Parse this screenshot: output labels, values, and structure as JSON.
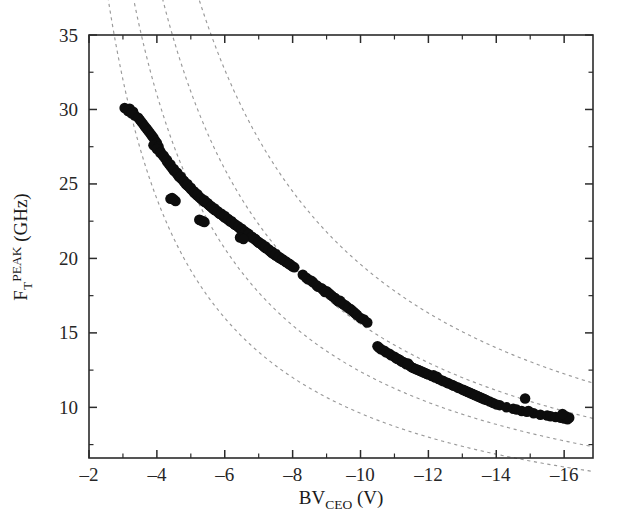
{
  "figure": {
    "background_color": "#ffffff",
    "frame_color": "#2b2b2b",
    "marker_color": "#0d0d0d",
    "guide_color": "#9a9a9a"
  },
  "axes": {
    "x": {
      "title_main": "BV",
      "title_sub": "CEO",
      "title_unit": " (V)",
      "full_label": "BV_CEO (V)",
      "min": -2,
      "max": -16.85,
      "major_ticks": [
        -2,
        -4,
        -6,
        -8,
        -10,
        -12,
        -14,
        -16
      ],
      "major_tick_labels": [
        "–2",
        "–4",
        "–6",
        "–8",
        "–10",
        "–12",
        "–14",
        "–16"
      ],
      "minor_ticks": [
        -3,
        -5,
        -7,
        -9,
        -11,
        -13,
        -15
      ]
    },
    "y": {
      "title_main": "F",
      "title_sub": "T",
      "title_sup": "PEAK",
      "title_unit": " (GHz)",
      "full_label": "F_T^PEAK (GHz)",
      "min": 6.6,
      "max": 35,
      "major_ticks": [
        10,
        15,
        20,
        25,
        30,
        35
      ],
      "major_tick_labels": [
        "10",
        "15",
        "20",
        "25",
        "30",
        "35"
      ],
      "minor_ticks": [
        7.5,
        12.5,
        17.5,
        22.5,
        27.5,
        32.5
      ]
    }
  },
  "chart_data": {
    "type": "scatter",
    "title": "",
    "xlabel": "BV_CEO (V)",
    "ylabel": "F_T^PEAK (GHz)",
    "xlim": [
      -2,
      -16.85
    ],
    "ylim": [
      6.6,
      35
    ],
    "grid": false,
    "legend": "none",
    "series": [
      {
        "name": "measured devices",
        "marker": "filled-circle",
        "color": "#0d0d0d",
        "marker_size_px": 10.5,
        "x": [
          -3.05,
          -3.2,
          -3.15,
          -3.3,
          -3.35,
          -3.25,
          -3.5,
          -3.45,
          -3.6,
          -3.55,
          -3.7,
          -3.65,
          -3.8,
          -3.75,
          -3.9,
          -3.85,
          -3.95,
          -4.0,
          -3.9,
          -4.05,
          -4.1,
          -4.0,
          -4.15,
          -4.2,
          -4.1,
          -4.25,
          -4.3,
          -4.2,
          -4.35,
          -4.4,
          -4.3,
          -4.45,
          -4.5,
          -4.4,
          -4.55,
          -4.6,
          -4.5,
          -4.65,
          -4.7,
          -4.6,
          -4.75,
          -4.8,
          -4.7,
          -4.85,
          -4.9,
          -4.8,
          -4.95,
          -5.0,
          -4.9,
          -5.05,
          -5.1,
          -5.0,
          -5.15,
          -5.2,
          -5.1,
          -5.25,
          -5.3,
          -5.2,
          -5.35,
          -5.4,
          -5.3,
          -5.45,
          -5.5,
          -5.4,
          -5.55,
          -5.6,
          -5.5,
          -5.65,
          -5.7,
          -5.6,
          -5.75,
          -5.8,
          -5.7,
          -5.85,
          -5.9,
          -5.8,
          -5.95,
          -6.0,
          -5.9,
          -6.05,
          -6.1,
          -6.0,
          -6.15,
          -6.2,
          -6.1,
          -6.25,
          -6.3,
          -6.2,
          -6.35,
          -6.4,
          -6.3,
          -6.45,
          -6.5,
          -6.4,
          -6.55,
          -6.6,
          -6.5,
          -6.65,
          -6.7,
          -6.6,
          -6.75,
          -6.8,
          -6.7,
          -6.85,
          -6.9,
          -6.8,
          -6.95,
          -7.0,
          -6.9,
          -7.05,
          -7.1,
          -7.0,
          -7.15,
          -7.2,
          -7.1,
          -7.25,
          -7.3,
          -7.2,
          -7.35,
          -7.4,
          -7.3,
          -7.45,
          -7.5,
          -7.4,
          -7.55,
          -7.6,
          -7.5,
          -7.65,
          -7.7,
          -7.6,
          -7.75,
          -7.8,
          -7.7,
          -7.85,
          -7.9,
          -7.8,
          -7.95,
          -8.0,
          -7.9,
          -8.05,
          -4.4,
          -4.55,
          -4.5,
          -4.45,
          -5.25,
          -5.35,
          -5.3,
          -5.4,
          -6.45,
          -6.55,
          -8.3,
          -8.45,
          -8.4,
          -8.6,
          -8.55,
          -8.7,
          -8.75,
          -8.9,
          -8.85,
          -9.0,
          -9.05,
          -9.2,
          -9.15,
          -9.3,
          -9.35,
          -9.5,
          -9.45,
          -9.6,
          -9.55,
          -9.7,
          -9.25,
          -9.4,
          -9.1,
          -8.95,
          -9.65,
          -9.75,
          -9.8,
          -9.85,
          -9.9,
          -10.0,
          -10.5,
          -10.6,
          -10.55,
          -10.7,
          -10.75,
          -10.9,
          -10.85,
          -11.0,
          -11.05,
          -11.2,
          -11.15,
          -11.3,
          -11.35,
          -11.5,
          -11.45,
          -11.6,
          -11.55,
          -11.7,
          -11.75,
          -11.9,
          -11.1,
          -11.25,
          -11.4,
          -11.65,
          -11.8,
          -11.85,
          -11.95,
          -12.0,
          -12.1,
          -12.2,
          -12.3,
          -12.45,
          -12.4,
          -12.6,
          -12.55,
          -12.7,
          -12.75,
          -12.9,
          -12.85,
          -13.0,
          -13.05,
          -13.2,
          -13.15,
          -13.3,
          -13.35,
          -13.5,
          -13.45,
          -13.6,
          -13.1,
          -13.25,
          -13.4,
          -13.55,
          -13.65,
          -13.7,
          -13.8,
          -13.9,
          -14.0,
          -14.1,
          -14.3,
          -14.5,
          -14.6,
          -14.75,
          -14.9,
          -15.1,
          -15.3,
          -15.5,
          -15.6,
          -15.75,
          -15.9,
          -16.0,
          -16.1,
          -16.15,
          -16.05,
          -15.95,
          -14.85,
          -14.95,
          -12.15,
          -12.25,
          -10.1,
          -10.2
        ],
        "y": [
          30.1,
          30.05,
          29.9,
          29.85,
          29.6,
          29.75,
          29.3,
          29.45,
          29.0,
          29.15,
          28.7,
          28.85,
          28.4,
          28.55,
          28.1,
          28.25,
          27.9,
          27.75,
          27.6,
          27.5,
          27.2,
          27.35,
          27.0,
          26.85,
          27.1,
          26.7,
          26.5,
          26.9,
          26.35,
          26.2,
          26.6,
          26.05,
          25.9,
          26.3,
          25.8,
          25.65,
          26.0,
          25.5,
          25.4,
          25.75,
          25.3,
          25.15,
          25.5,
          25.0,
          24.9,
          25.2,
          24.8,
          24.65,
          25.0,
          24.55,
          24.4,
          24.75,
          24.3,
          24.2,
          24.5,
          24.1,
          24.0,
          24.3,
          23.9,
          23.8,
          24.05,
          23.75,
          23.65,
          23.9,
          23.55,
          23.45,
          23.7,
          23.35,
          23.25,
          23.5,
          23.2,
          23.1,
          23.35,
          23.0,
          22.95,
          23.15,
          22.85,
          22.75,
          23.0,
          22.7,
          22.6,
          22.85,
          22.5,
          22.45,
          22.65,
          22.35,
          22.25,
          22.5,
          22.2,
          22.1,
          22.3,
          22.0,
          21.9,
          22.15,
          21.85,
          21.75,
          22.0,
          21.7,
          21.6,
          21.8,
          21.5,
          21.4,
          21.65,
          21.35,
          21.25,
          21.45,
          21.15,
          21.05,
          21.3,
          21.0,
          20.9,
          21.1,
          20.8,
          20.7,
          20.95,
          20.65,
          20.55,
          20.8,
          20.45,
          20.35,
          20.6,
          20.3,
          20.2,
          20.45,
          20.15,
          20.05,
          20.3,
          20.0,
          19.9,
          20.1,
          19.85,
          19.75,
          19.95,
          19.7,
          19.6,
          19.8,
          19.55,
          19.45,
          19.65,
          19.4,
          24.0,
          23.85,
          23.95,
          24.05,
          22.6,
          22.5,
          22.55,
          22.45,
          21.4,
          21.3,
          18.9,
          18.6,
          18.7,
          18.4,
          18.5,
          18.2,
          18.1,
          17.9,
          18.0,
          17.8,
          17.7,
          17.4,
          17.5,
          17.2,
          17.1,
          16.9,
          17.0,
          16.75,
          16.85,
          16.6,
          17.35,
          17.15,
          17.6,
          17.75,
          16.65,
          16.5,
          16.4,
          16.3,
          16.2,
          16.0,
          14.1,
          13.9,
          14.0,
          13.8,
          13.7,
          13.5,
          13.6,
          13.4,
          13.3,
          13.1,
          13.2,
          13.0,
          12.9,
          12.7,
          12.8,
          12.6,
          12.65,
          12.5,
          12.45,
          12.3,
          13.25,
          13.05,
          12.95,
          12.55,
          12.4,
          12.35,
          12.25,
          12.2,
          12.1,
          12.0,
          11.9,
          11.75,
          11.8,
          11.6,
          11.65,
          11.5,
          11.45,
          11.3,
          11.35,
          11.2,
          11.15,
          11.0,
          11.05,
          10.9,
          10.85,
          10.7,
          10.75,
          10.6,
          11.1,
          10.95,
          10.8,
          10.65,
          10.55,
          10.5,
          10.4,
          10.3,
          10.2,
          10.15,
          10.0,
          9.9,
          9.85,
          9.75,
          9.7,
          9.6,
          9.5,
          9.45,
          9.4,
          9.35,
          9.3,
          9.25,
          9.2,
          9.3,
          9.4,
          9.55,
          10.6,
          9.75,
          12.15,
          12.05,
          15.9,
          15.7
        ]
      }
    ],
    "guide_curves": [
      {
        "name": "johnson-limit-1",
        "constant_ghz_v": 96,
        "style": "dashed"
      },
      {
        "name": "johnson-limit-2",
        "constant_ghz_v": 124,
        "style": "dashed"
      },
      {
        "name": "johnson-limit-3",
        "constant_ghz_v": 156,
        "style": "dashed"
      },
      {
        "name": "johnson-limit-4",
        "constant_ghz_v": 196,
        "style": "dashed"
      }
    ],
    "annotations": []
  }
}
